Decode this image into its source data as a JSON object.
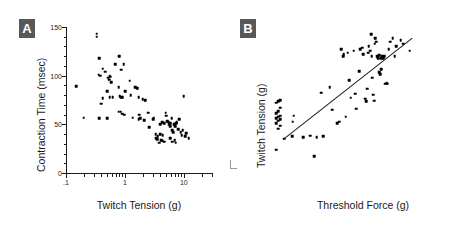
{
  "figure": {
    "background": "#ffffff",
    "ink": "#1a1a1a",
    "badge_bg": "#58585a",
    "badge_fg": "#ffffff"
  },
  "panels": [
    {
      "id": "A",
      "badge_label": "A",
      "chart_data": {
        "type": "scatter",
        "title": "",
        "xlabel": "Twitch Tension (g)",
        "ylabel": "Contraction Time (msec)",
        "xscale": "log",
        "yscale": "linear",
        "xlim": [
          0.1,
          30
        ],
        "ylim": [
          0,
          150
        ],
        "xticks": [
          0.1,
          1,
          10
        ],
        "xticklabels": [
          ".1",
          "1",
          "10"
        ],
        "yticks": [
          0,
          50,
          100,
          150
        ],
        "yticklabels": [
          "0",
          "50",
          "100",
          "150"
        ],
        "grid": false,
        "legend": null,
        "points": [
          [
            0.15,
            89
          ],
          [
            0.2,
            57
          ],
          [
            0.33,
            143
          ],
          [
            0.33,
            140
          ],
          [
            0.37,
            118
          ],
          [
            0.36,
            101
          ],
          [
            0.38,
            100
          ],
          [
            0.42,
            107
          ],
          [
            0.46,
            104
          ],
          [
            0.52,
            98
          ],
          [
            0.54,
            96
          ],
          [
            0.55,
            100
          ],
          [
            0.56,
            99
          ],
          [
            0.58,
            93
          ],
          [
            0.5,
            84
          ],
          [
            0.55,
            78
          ],
          [
            0.42,
            77
          ],
          [
            0.4,
            71
          ],
          [
            0.37,
            56
          ],
          [
            0.5,
            56
          ],
          [
            0.62,
            78
          ],
          [
            0.68,
            112
          ],
          [
            0.8,
            120
          ],
          [
            0.86,
            106
          ],
          [
            0.95,
            112
          ],
          [
            0.78,
            88
          ],
          [
            0.82,
            79
          ],
          [
            0.86,
            78
          ],
          [
            0.92,
            78
          ],
          [
            0.78,
            63
          ],
          [
            0.85,
            63
          ],
          [
            0.9,
            61
          ],
          [
            0.98,
            60
          ],
          [
            1.0,
            84
          ],
          [
            1.2,
            95
          ],
          [
            1.25,
            80
          ],
          [
            1.35,
            57
          ],
          [
            1.5,
            88
          ],
          [
            1.62,
            87
          ],
          [
            1.7,
            78
          ],
          [
            1.8,
            56
          ],
          [
            1.72,
            55
          ],
          [
            1.75,
            60
          ],
          [
            2.0,
            76
          ],
          [
            2.2,
            75
          ],
          [
            2.1,
            54
          ],
          [
            2.5,
            62
          ],
          [
            2.6,
            47
          ],
          [
            3.0,
            55
          ],
          [
            3.1,
            57
          ],
          [
            3.3,
            40
          ],
          [
            3.4,
            36
          ],
          [
            3.5,
            35
          ],
          [
            3.6,
            38
          ],
          [
            3.8,
            31
          ],
          [
            4.0,
            40
          ],
          [
            4.1,
            34
          ],
          [
            4.3,
            33
          ],
          [
            4.4,
            39
          ],
          [
            4.6,
            32
          ],
          [
            4.0,
            50
          ],
          [
            4.3,
            52
          ],
          [
            4.6,
            51
          ],
          [
            4.9,
            62
          ],
          [
            5.0,
            59
          ],
          [
            5.2,
            53
          ],
          [
            5.5,
            52
          ],
          [
            5.6,
            50
          ],
          [
            5.8,
            48
          ],
          [
            6.0,
            51
          ],
          [
            6.2,
            56
          ],
          [
            6.4,
            44
          ],
          [
            6.6,
            42
          ],
          [
            6.8,
            50
          ],
          [
            7.0,
            49
          ],
          [
            7.2,
            48
          ],
          [
            7.4,
            51
          ],
          [
            7.6,
            52
          ],
          [
            7.0,
            34
          ],
          [
            7.3,
            31
          ],
          [
            6.3,
            32
          ],
          [
            5.9,
            36
          ],
          [
            8.0,
            45
          ],
          [
            8.4,
            55
          ],
          [
            8.8,
            42
          ],
          [
            9.2,
            39
          ],
          [
            9.6,
            44
          ],
          [
            10.0,
            79
          ],
          [
            10.5,
            38
          ],
          [
            11.0,
            41
          ],
          [
            12.0,
            36
          ]
        ]
      }
    },
    {
      "id": "B",
      "badge_label": "B",
      "chart_data": {
        "type": "scatter",
        "title": "",
        "xlabel": "Threshold Force (g)",
        "ylabel": "Twitch Tension (g)",
        "xscale": "log",
        "yscale": "log",
        "xlim": [
          2,
          1000
        ],
        "ylim": [
          0.1,
          40
        ],
        "xticks": [
          10,
          100,
          1000
        ],
        "xticklabels": [
          "10",
          "100",
          "1000"
        ],
        "x_break_label": "<20",
        "x_break_symbol": "//",
        "yticks": [
          0.1,
          1,
          10
        ],
        "yticklabels": [
          ".1",
          "1",
          "10"
        ],
        "grid": false,
        "legend": null,
        "fit_line": {
          "x1": 3.1,
          "y1": 0.41,
          "x2": 420,
          "y2": 26.0
        },
        "offscale_points": [
          [
            0.26
          ],
          [
            0.62
          ],
          [
            0.7
          ],
          [
            0.78
          ],
          [
            0.85
          ],
          [
            0.9
          ],
          [
            0.95
          ],
          [
            1.0
          ],
          [
            1.05
          ],
          [
            1.15
          ],
          [
            1.25
          ],
          [
            1.45
          ],
          [
            1.8
          ],
          [
            1.9
          ],
          [
            2.0
          ]
        ],
        "points": [
          [
            3.2,
            0.41
          ],
          [
            4.3,
            0.45
          ],
          [
            4.4,
            0.82
          ],
          [
            4.6,
            1.05
          ],
          [
            6.5,
            0.43
          ],
          [
            8.5,
            0.46
          ],
          [
            10.0,
            0.2
          ],
          [
            11.0,
            0.43
          ],
          [
            13.0,
            2.7
          ],
          [
            14.0,
            0.45
          ],
          [
            18.0,
            3.4
          ],
          [
            20.0,
            1.35
          ],
          [
            24.0,
            0.78
          ],
          [
            26.0,
            0.82
          ],
          [
            28.0,
            16.0
          ],
          [
            30.0,
            12.0
          ],
          [
            31.0,
            13.0
          ],
          [
            33.0,
            1.0
          ],
          [
            36.0,
            14.0
          ],
          [
            38.0,
            4.5
          ],
          [
            40.0,
            2.2
          ],
          [
            45.0,
            15.0
          ],
          [
            48.0,
            2.6
          ],
          [
            50.0,
            1.4
          ],
          [
            55.0,
            6.5
          ],
          [
            58.0,
            16.0
          ],
          [
            62.0,
            17.0
          ],
          [
            65.0,
            13.0
          ],
          [
            70.0,
            2.1
          ],
          [
            72.0,
            1.9
          ],
          [
            75.0,
            3.2
          ],
          [
            78.0,
            14.0
          ],
          [
            80.0,
            18.0
          ],
          [
            84.0,
            15.0
          ],
          [
            88.0,
            30.0
          ],
          [
            90.0,
            12.0
          ],
          [
            92.0,
            5.0
          ],
          [
            95.0,
            2.5
          ],
          [
            98.0,
            1.95
          ],
          [
            100.0,
            20.0
          ],
          [
            103.0,
            25.0
          ],
          [
            106.0,
            22.0
          ],
          [
            110.0,
            12.0
          ],
          [
            112.0,
            11.5
          ],
          [
            115.0,
            11.0
          ],
          [
            118.0,
            12.5
          ],
          [
            120.0,
            6.2
          ],
          [
            124.0,
            5.8
          ],
          [
            128.0,
            7.0
          ],
          [
            130.0,
            11.0
          ],
          [
            134.0,
            12.0
          ],
          [
            140.0,
            11.0
          ],
          [
            145.0,
            12.0
          ],
          [
            150.0,
            3.9
          ],
          [
            158.0,
            4.0
          ],
          [
            162.0,
            3.9
          ],
          [
            170.0,
            16.0
          ],
          [
            180.0,
            22.0
          ],
          [
            200.0,
            25.0
          ],
          [
            215.0,
            12.0
          ],
          [
            230.0,
            18.0
          ],
          [
            270.0,
            23.0
          ],
          [
            300.0,
            20.0
          ],
          [
            380.0,
            15.0
          ]
        ]
      }
    }
  ]
}
